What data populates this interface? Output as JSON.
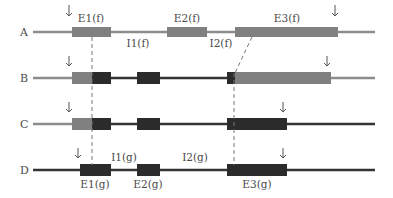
{
  "diagram": {
    "rows": [
      {
        "label": "A"
      },
      {
        "label": "B"
      },
      {
        "label": "C"
      },
      {
        "label": "D"
      }
    ],
    "row_a": {
      "exon1": "E1(f)",
      "exon2": "E2(f)",
      "exon3": "E3(f)",
      "intron1": "I1(f)",
      "intron2": "I2(f)"
    },
    "row_d": {
      "exon1": "E1(g)",
      "exon2": "E2(g)",
      "exon3": "E3(g)",
      "intron1": "I1(g)",
      "intron2": "I2(g)"
    },
    "legend_colors": {
      "gene_f_exon": "#808080",
      "gene_g_exon": "#2b2b2b",
      "gene_f_line": "#8c8c8c",
      "gene_g_line": "#333333",
      "junction_dash": "#777777"
    }
  }
}
